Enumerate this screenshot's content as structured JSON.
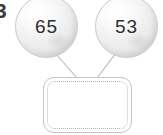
{
  "item": {
    "number_label": "3"
  },
  "colors": {
    "background": "#ffffff",
    "ball_fill": "#f0f0f0",
    "ball_border": "#c9c9c9",
    "number_text": "#2e2e2e",
    "connector_line": "#b5b5b5",
    "box_border": "#c4c4c4",
    "box_inner_dotted": "#b9b9b9"
  },
  "diagram": {
    "type": "number-bond",
    "operands": [
      {
        "name": "left-addend",
        "value": "65",
        "shape": "circle"
      },
      {
        "name": "right-addend",
        "value": "53",
        "shape": "circle"
      }
    ],
    "result": {
      "name": "sum-answer-box",
      "value": "",
      "shape": "rounded-rectangle",
      "placeholder": ""
    },
    "connectors": [
      {
        "name": "connector-left",
        "from": "left-addend",
        "to": "sum-answer-box"
      },
      {
        "name": "connector-right",
        "from": "right-addend",
        "to": "sum-answer-box"
      }
    ]
  }
}
